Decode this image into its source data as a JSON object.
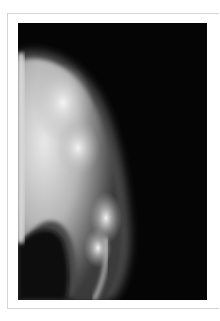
{
  "figure": {
    "type": "radiograph",
    "colors": {
      "page_background": "#ffffff",
      "frame_border": "#d4d4d4",
      "film_background": "#050505",
      "bone": "#d9d9d9",
      "soft_tissue": "#9a9a9a",
      "calcification": "#eeeeee"
    }
  }
}
